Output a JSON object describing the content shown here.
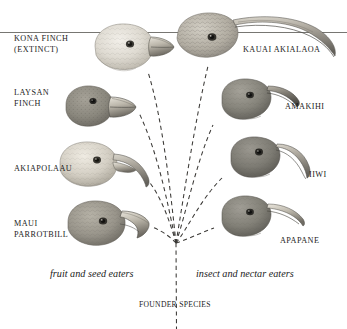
{
  "figure": {
    "ink_color": "#1c1c1c",
    "background": "#ffffff"
  },
  "top_rule": {
    "name": "horizontal-rule"
  },
  "founder": {
    "label": "FOUNDER SPECIES",
    "x": 176,
    "y": 302
  },
  "captions": {
    "left": "fruit and seed eaters",
    "right": "insect and nectar eaters"
  },
  "birds": [
    {
      "id": "kona-finch",
      "label": "KONA FINCH\n(EXTINCT)",
      "label_lines": [
        "KONA FINCH",
        "(EXTINCT)"
      ],
      "side": "left",
      "beak": "thick conical seed-crushing",
      "tone": "#d8d4cc",
      "label_x": 14,
      "label_y": 36
    },
    {
      "id": "laysan-finch",
      "label": "LAYSAN\nFINCH",
      "label_lines": [
        "LAYSAN",
        "FINCH"
      ],
      "side": "left",
      "beak": "thick conical seed-crushing",
      "tone": "#8d8b84",
      "label_x": 14,
      "label_y": 90
    },
    {
      "id": "akiapolaau",
      "label": "AKIAPOLAAU",
      "label_lines": [
        "AKIAPOLAAU"
      ],
      "side": "left",
      "beak": "long curved upper bill, short straight lower bill",
      "tone": "#cfcabf",
      "label_x": 14,
      "label_y": 166
    },
    {
      "id": "maui-parrotbill",
      "label": "MAUI\nPARROTBILL",
      "label_lines": [
        "MAUI",
        "PARROTBILL"
      ],
      "side": "left",
      "beak": "heavy hooked parrot-like",
      "tone": "#9d9a90",
      "label_x": 14,
      "label_y": 222
    },
    {
      "id": "kauai-akialaoa",
      "label": "KAUAI AKIALAOA",
      "label_lines": [
        "KAUAI AKIALAOA"
      ],
      "side": "right",
      "beak": "very long sickle-shaped decurved",
      "tone": "#b0aca2",
      "label_x": 245,
      "label_y": 48
    },
    {
      "id": "amakihi",
      "label": "AMAKIHI",
      "label_lines": [
        "AMAKIHI"
      ],
      "side": "right",
      "beak": "short decurved",
      "tone": "#8a887f",
      "label_x": 286,
      "label_y": 105
    },
    {
      "id": "iiwi",
      "label": "IIWI",
      "label_lines": [
        "IIWI"
      ],
      "side": "right",
      "beak": "long strongly decurved",
      "tone": "#807e76",
      "label_x": 310,
      "label_y": 172
    },
    {
      "id": "apapane",
      "label": "APAPANE",
      "label_lines": [
        "APAPANE"
      ],
      "side": "right",
      "beak": "slender slightly decurved",
      "tone": "#86847c",
      "label_x": 281,
      "label_y": 238
    }
  ]
}
